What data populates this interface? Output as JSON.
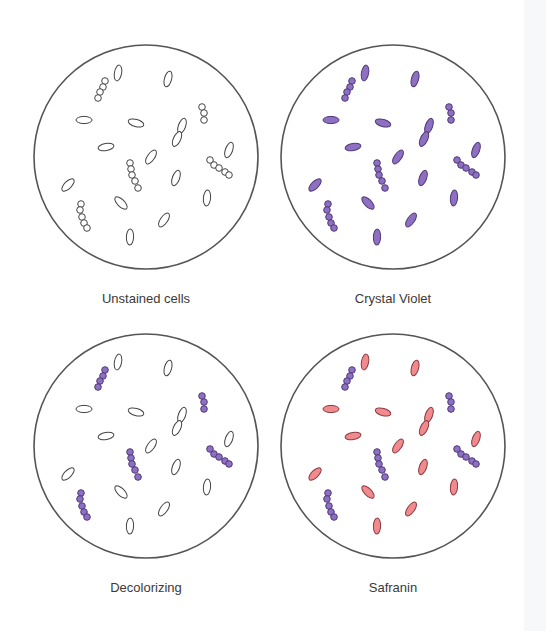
{
  "figure": {
    "colors": {
      "outline": "#555555",
      "unstained_fill": "#ffffff",
      "crystal_violet": "#8e6fc1",
      "crystal_violet_stroke": "#4e3a78",
      "safranin": "#f08a8e",
      "safranin_stroke": "#8a3a40",
      "label_text": "#3a3a3a"
    },
    "panels": [
      {
        "label": "Unstained cells",
        "cx": 146,
        "cy": 157,
        "rod_fill": "unstained",
        "cocci_fill": "unstained"
      },
      {
        "label": "Crystal Violet",
        "cx": 393,
        "cy": 157,
        "rod_fill": "violet",
        "cocci_fill": "violet"
      },
      {
        "label": "Decolorizing",
        "cx": 146,
        "cy": 446,
        "rod_fill": "unstained",
        "cocci_fill": "violet"
      },
      {
        "label": "Safranin",
        "cx": 393,
        "cy": 446,
        "rod_fill": "safranin",
        "cocci_fill": "violet"
      }
    ],
    "radius": 112,
    "rods": [
      {
        "x": -28,
        "y": -84,
        "rot": 80
      },
      {
        "x": 22,
        "y": -78,
        "rot": 75
      },
      {
        "x": -62,
        "y": -37,
        "rot": 0
      },
      {
        "x": -10,
        "y": -34,
        "rot": -15
      },
      {
        "x": 36,
        "y": -31,
        "rot": 70
      },
      {
        "x": 31,
        "y": -18,
        "rot": 65
      },
      {
        "x": -40,
        "y": -10,
        "rot": 10
      },
      {
        "x": 5,
        "y": 0,
        "rot": 55
      },
      {
        "x": 83,
        "y": -7,
        "rot": 70
      },
      {
        "x": -78,
        "y": 28,
        "rot": 45
      },
      {
        "x": 30,
        "y": 21,
        "rot": 70
      },
      {
        "x": -25,
        "y": 46,
        "rot": -45
      },
      {
        "x": 61,
        "y": 41,
        "rot": 85
      },
      {
        "x": 18,
        "y": 63,
        "rot": 55
      },
      {
        "x": -16,
        "y": 80,
        "rot": 88
      }
    ],
    "cocci_chains": [
      [
        [
          -41,
          -76
        ],
        [
          -43,
          -70
        ],
        [
          -46,
          -65
        ],
        [
          -48,
          -59
        ]
      ],
      [
        [
          56,
          -50
        ],
        [
          58,
          -44
        ],
        [
          58,
          -37
        ]
      ],
      [
        [
          -16,
          6
        ],
        [
          -15,
          12
        ],
        [
          -14,
          18
        ],
        [
          -11,
          24
        ],
        [
          -8,
          31
        ]
      ],
      [
        [
          64,
          3
        ],
        [
          68,
          8
        ],
        [
          73,
          11
        ],
        [
          79,
          15
        ],
        [
          83,
          18
        ]
      ],
      [
        [
          -65,
          47
        ],
        [
          -66,
          53
        ],
        [
          -64,
          60
        ],
        [
          -62,
          66
        ],
        [
          -59,
          71
        ]
      ]
    ]
  }
}
